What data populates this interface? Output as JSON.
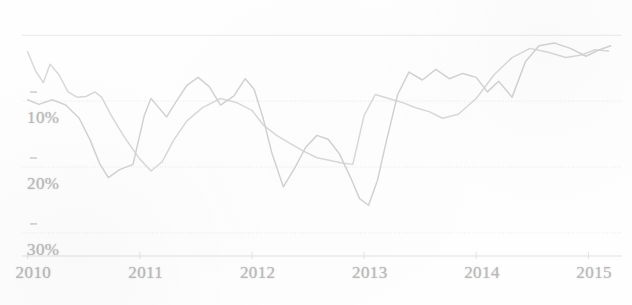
{
  "chart_data": {
    "type": "line",
    "title": "",
    "subtitle": "",
    "xlabel": "",
    "ylabel": "",
    "xlim": [
      2009.95,
      2015.3
    ],
    "ylim": [
      -33.5,
      2.0
    ],
    "grid": true,
    "legend_position": "none",
    "y_axis_note": "Values are negative percentages (drawdown); tick labels printed without minus sign",
    "x_tick_labels": [
      "2010",
      "2011",
      "2012",
      "2013",
      "2014",
      "2015"
    ],
    "x_tick_values": [
      2010,
      2011,
      2012,
      2013,
      2014,
      2015
    ],
    "y_tick_labels": [
      "10%",
      "20%",
      "30%"
    ],
    "y_tick_values": [
      -10,
      -20,
      -30
    ],
    "gridline_values": [
      0,
      -10,
      -20,
      -30
    ],
    "series": [
      {
        "name": "series-a",
        "color": "#d8d8d8",
        "x": [
          2010.0,
          2010.07,
          2010.14,
          2010.2,
          2010.28,
          2010.36,
          2010.44,
          2010.52,
          2010.6,
          2010.66,
          2010.74,
          2010.86,
          2011.0,
          2011.1,
          2011.2,
          2011.3,
          2011.42,
          2011.56,
          2011.72,
          2011.86,
          2012.0,
          2012.1,
          2012.22,
          2012.34,
          2012.46,
          2012.58,
          2012.7,
          2012.8,
          2012.9,
          2013.0,
          2013.1,
          2013.22,
          2013.34,
          2013.46,
          2013.58,
          2013.7,
          2013.84,
          2014.0,
          2014.16,
          2014.32,
          2014.48,
          2014.64,
          2014.8,
          2014.94,
          2015.06,
          2015.18
        ],
        "y": [
          -2.5,
          -5.4,
          -7.2,
          -4.4,
          -6.0,
          -8.6,
          -9.4,
          -9.3,
          -8.6,
          -9.4,
          -12.0,
          -15.4,
          -18.8,
          -20.6,
          -19.2,
          -16.0,
          -13.0,
          -11.0,
          -9.6,
          -10.2,
          -11.4,
          -13.6,
          -15.2,
          -16.4,
          -17.6,
          -18.6,
          -19.0,
          -19.4,
          -19.6,
          -12.2,
          -9.0,
          -9.6,
          -10.2,
          -11.0,
          -11.6,
          -12.6,
          -12.0,
          -9.6,
          -6.0,
          -3.4,
          -2.0,
          -2.6,
          -3.4,
          -3.0,
          -2.2,
          -2.4
        ]
      },
      {
        "name": "series-b",
        "color": "#d2d2d2",
        "x": [
          2010.0,
          2010.1,
          2010.22,
          2010.34,
          2010.46,
          2010.56,
          2010.64,
          2010.72,
          2010.82,
          2010.94,
          2011.04,
          2011.1,
          2011.16,
          2011.24,
          2011.32,
          2011.42,
          2011.52,
          2011.62,
          2011.72,
          2011.84,
          2011.94,
          2012.02,
          2012.1,
          2012.18,
          2012.28,
          2012.38,
          2012.48,
          2012.58,
          2012.68,
          2012.78,
          2012.88,
          2012.96,
          2013.04,
          2013.12,
          2013.2,
          2013.3,
          2013.4,
          2013.52,
          2013.64,
          2013.76,
          2013.88,
          2014.0,
          2014.1,
          2014.2,
          2014.32,
          2014.44,
          2014.56,
          2014.7,
          2014.84,
          2014.98,
          2015.1,
          2015.2
        ],
        "y": [
          -9.8,
          -10.5,
          -9.8,
          -10.6,
          -12.6,
          -16.0,
          -19.4,
          -21.6,
          -20.4,
          -19.6,
          -12.2,
          -9.6,
          -10.8,
          -12.4,
          -10.2,
          -7.6,
          -6.4,
          -7.8,
          -10.6,
          -9.2,
          -6.6,
          -8.2,
          -12.6,
          -18.0,
          -23.0,
          -20.2,
          -17.0,
          -15.2,
          -15.8,
          -18.0,
          -21.6,
          -24.8,
          -25.8,
          -22.0,
          -16.0,
          -9.0,
          -5.6,
          -6.8,
          -5.2,
          -6.6,
          -5.8,
          -6.4,
          -8.6,
          -7.0,
          -9.4,
          -4.0,
          -1.6,
          -1.2,
          -2.0,
          -3.2,
          -2.2,
          -1.6
        ]
      }
    ]
  },
  "axes": {
    "y_ticks": [
      {
        "label": "10%",
        "value": -10
      },
      {
        "label": "20%",
        "value": -20
      },
      {
        "label": "30%",
        "value": -30
      }
    ],
    "x_ticks": [
      {
        "label": "2010",
        "value": 2010
      },
      {
        "label": "2011",
        "value": 2011
      },
      {
        "label": "2012",
        "value": 2012
      },
      {
        "label": "2013",
        "value": 2013
      },
      {
        "label": "2014",
        "value": 2014
      },
      {
        "label": "2015",
        "value": 2015
      }
    ]
  },
  "style": {
    "line_color_a": "#d8d8d8",
    "line_color_b": "#d2d2d2",
    "gridline_color": "#e9e9e9",
    "axis_line_color": "#e0e0e0",
    "tick_label_color": "#b9b9b9",
    "background": "#fefefe"
  }
}
